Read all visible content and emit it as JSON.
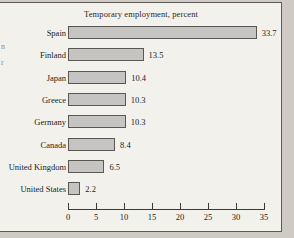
{
  "figure": {
    "bleed_text": "n\nr"
  },
  "chart_data": {
    "type": "bar",
    "orientation": "horizontal",
    "title": "Temporary employment, percent",
    "xlabel": "",
    "ylabel": "",
    "categories": [
      "Spain",
      "Finland",
      "Japan",
      "Greece",
      "Germany",
      "Canada",
      "United Kingdom",
      "United States"
    ],
    "values": [
      33.7,
      13.5,
      10.4,
      10.3,
      10.3,
      8.4,
      6.5,
      2.2
    ],
    "value_labels": [
      "33.7",
      "13.5",
      "10.4",
      "10.3",
      "10.3",
      "8.4",
      "6.5",
      "2.2"
    ],
    "xlim": [
      0,
      35
    ],
    "xticks": [
      0,
      5,
      10,
      15,
      20,
      25,
      30,
      35
    ],
    "xtick_labels": [
      "0",
      "5",
      "10",
      "15",
      "20",
      "25",
      "30",
      "35"
    ],
    "grid": false,
    "legend": null,
    "bar_fill": "#c5c4c2",
    "bar_edge": "#5a5854"
  }
}
